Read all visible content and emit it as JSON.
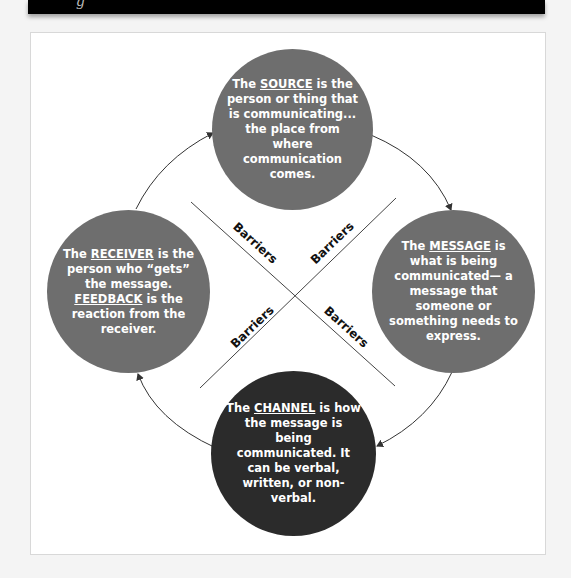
{
  "header": {
    "glyph": "g"
  },
  "diagram": {
    "colors": {
      "gray_circle": "#6e6e6e",
      "channel_circle": "#2b2b2b",
      "text": "#ffffff",
      "lines": "#444444"
    },
    "nodes": {
      "source": {
        "prefix": "The ",
        "keyword": "SOURCE",
        "rest": " is the person or thing that is communicating... the place from where communication comes."
      },
      "message": {
        "prefix": "The ",
        "keyword": "MESSAGE",
        "rest": " is what is being communicated— a message that someone or something needs to express."
      },
      "channel": {
        "prefix": "The ",
        "keyword": "CHANNEL",
        "rest": " is how the message is being communicated. It can be verbal, written, or non-verbal."
      },
      "receiver": {
        "prefix": "The ",
        "keyword": "RECEIVER",
        "mid": " is the person who “gets” the message. ",
        "keyword2": "FEEDBACK",
        "rest": " is the reaction from the receiver."
      }
    },
    "barriers": [
      {
        "label": "Barriers"
      },
      {
        "label": "Barriers"
      },
      {
        "label": "Barriers"
      },
      {
        "label": "Barriers"
      }
    ],
    "flow": [
      "source",
      "message",
      "channel",
      "receiver",
      "source"
    ]
  }
}
